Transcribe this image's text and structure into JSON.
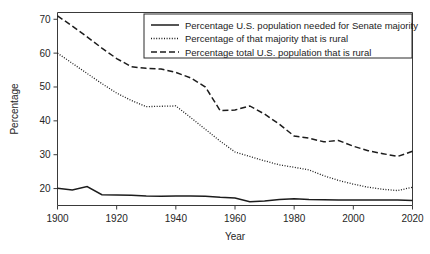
{
  "chart_data": {
    "type": "line",
    "title": "",
    "xlabel": "Year",
    "ylabel": "Percentage",
    "xlim": [
      1900,
      2020
    ],
    "ylim": [
      15,
      72
    ],
    "xticks": [
      1900,
      1920,
      1940,
      1960,
      1980,
      2000,
      2020
    ],
    "yticks": [
      20,
      30,
      40,
      50,
      60,
      70
    ],
    "grid": false,
    "legend_position": "top-right",
    "x": [
      1900,
      1905,
      1910,
      1915,
      1920,
      1925,
      1930,
      1935,
      1940,
      1945,
      1950,
      1955,
      1960,
      1965,
      1970,
      1975,
      1980,
      1985,
      1990,
      1995,
      2000,
      2005,
      2010,
      2015,
      2020
    ],
    "series": [
      {
        "name": "Percentage U.S. population needed for Senate majority",
        "style": "solid",
        "values": [
          20.1,
          19.6,
          20.6,
          18.2,
          18.1,
          18.0,
          17.8,
          17.7,
          17.8,
          17.8,
          17.7,
          17.4,
          17.2,
          16.1,
          16.3,
          16.8,
          17.0,
          16.8,
          16.7,
          16.6,
          16.6,
          16.6,
          16.6,
          16.6,
          16.5
        ]
      },
      {
        "name": "Percentage of that majority that is rural",
        "style": "dotted",
        "values": [
          60.0,
          57.0,
          54.0,
          51.0,
          48.2,
          46.0,
          44.2,
          44.3,
          44.4,
          41.0,
          37.5,
          34.0,
          30.8,
          29.5,
          28.2,
          27.0,
          26.3,
          25.5,
          23.8,
          22.4,
          21.3,
          20.4,
          19.8,
          19.4,
          20.4
        ]
      },
      {
        "name": "Percentage total U.S. population that is rural",
        "style": "dashed",
        "values": [
          71.0,
          68.0,
          64.8,
          61.5,
          58.4,
          56.0,
          55.5,
          55.3,
          54.3,
          52.7,
          50.0,
          43.0,
          43.2,
          44.4,
          42.0,
          39.0,
          35.5,
          34.9,
          33.8,
          34.2,
          32.5,
          31.2,
          30.3,
          29.5,
          31.0
        ]
      }
    ]
  },
  "legend": {
    "entries": [
      {
        "label": "Percentage U.S. population needed for Senate majority",
        "style": "solid"
      },
      {
        "label": "Percentage of that majority that is rural",
        "style": "dotted"
      },
      {
        "label": "Percentage total U.S. population that is rural",
        "style": "dashed"
      }
    ]
  }
}
